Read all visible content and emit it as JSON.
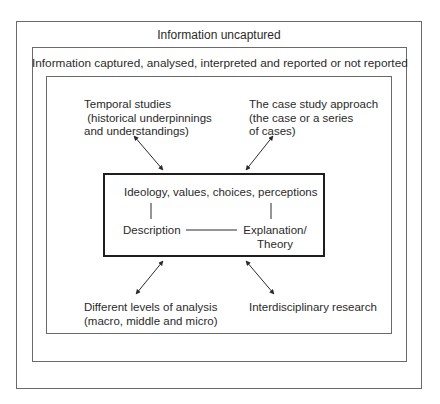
{
  "diagram": {
    "outer_label": "Information uncaptured",
    "middle_label": "Information captured, analysed, interpreted and reported or not reported",
    "nodes": {
      "top_left": "Temporal studies\n (historical underpinnings\nand understandings)",
      "top_right": "The case study approach\n(the case or a series\nof cases)",
      "bottom_left": "Different levels of analysis\n(macro, middle and micro)",
      "bottom_right": "Interdisciplinary research"
    },
    "core": {
      "top": "Ideology, values, choices, perceptions",
      "left": "Description",
      "right": "Explanation/\nTheory"
    },
    "arrows": [
      {
        "from": "top_left",
        "to": "core",
        "type": "bidirectional"
      },
      {
        "from": "top_right",
        "to": "core",
        "type": "bidirectional"
      },
      {
        "from": "bottom_left",
        "to": "core",
        "type": "bidirectional"
      },
      {
        "from": "bottom_right",
        "to": "core",
        "type": "bidirectional"
      }
    ],
    "colors": {
      "border": "#6a6a6a",
      "core_border": "#1e1e1e",
      "text": "#2a2a2a"
    }
  }
}
